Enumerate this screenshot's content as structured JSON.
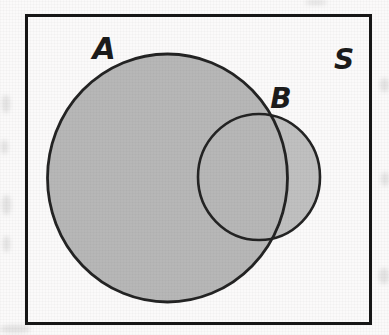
{
  "figure": {
    "labels": {
      "set_a": "A",
      "set_b": "B",
      "universe": "S"
    },
    "colors": {
      "paper": "#fbfafa",
      "frame": "#161616",
      "outline": "#232323",
      "set_a_fill": "#b7b7b7",
      "set_b_fill": "#c0c0c0",
      "label": "#1b1b1b"
    }
  }
}
